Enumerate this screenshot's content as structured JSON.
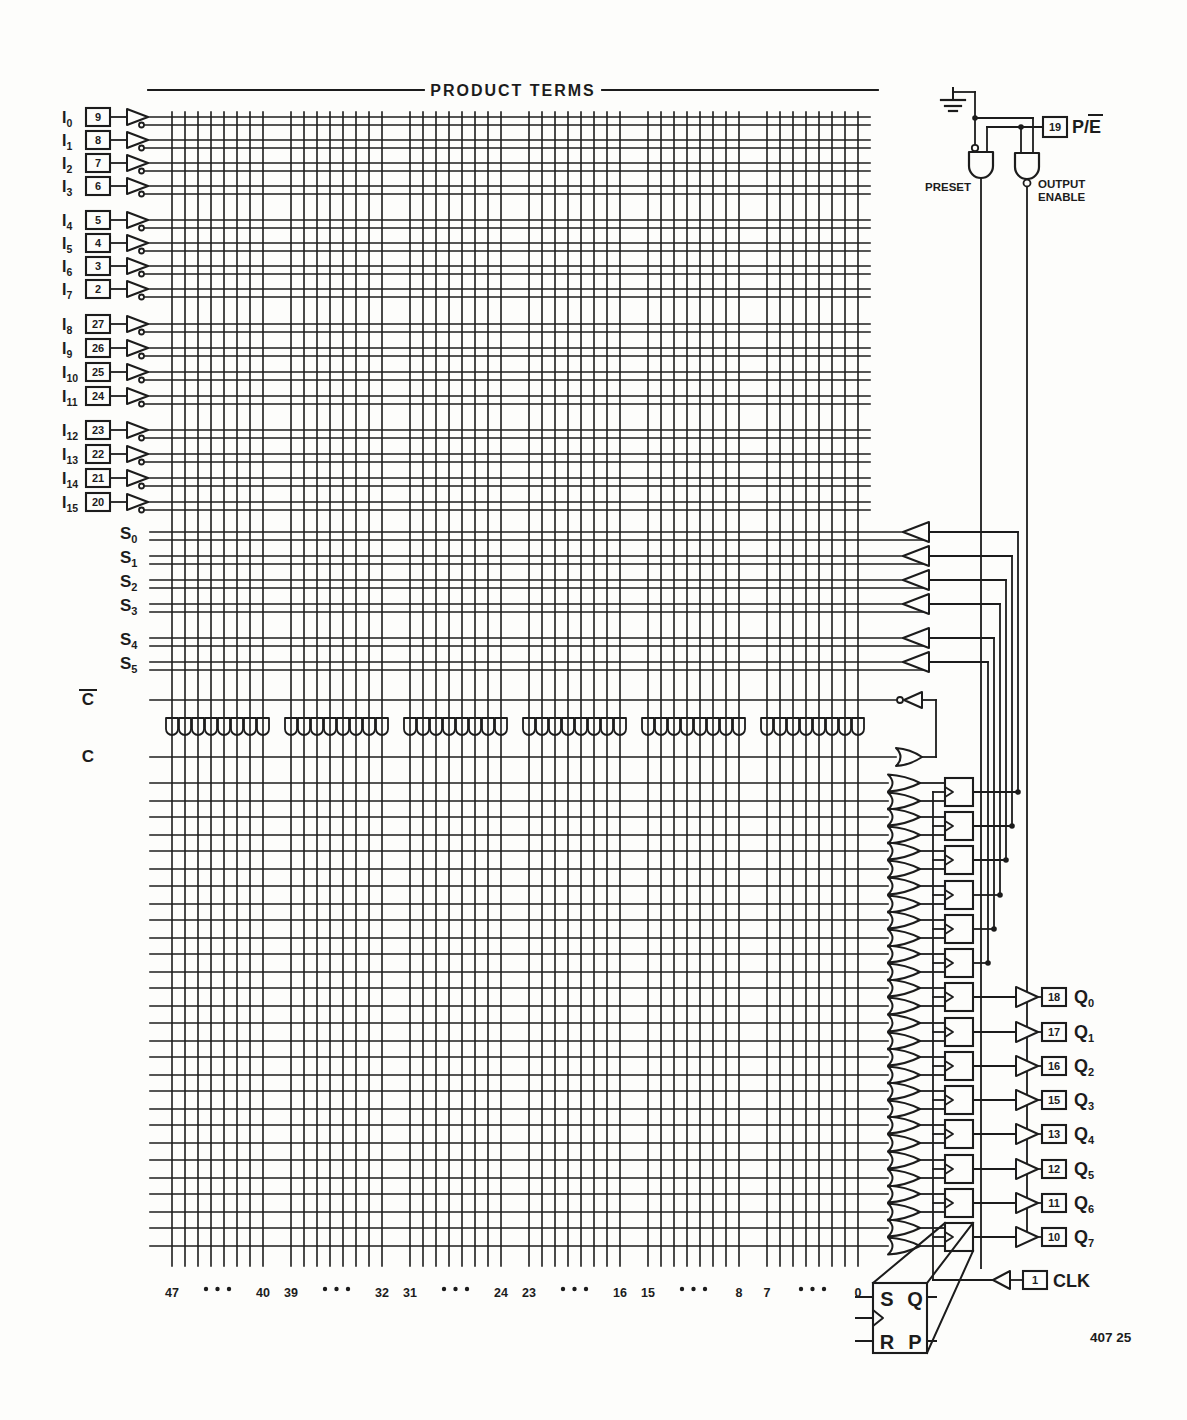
{
  "title": "PRODUCT TERMS",
  "fig_number": "407 25",
  "inputs": [
    {
      "label": "I",
      "sub": "0",
      "pin": "9"
    },
    {
      "label": "I",
      "sub": "1",
      "pin": "8"
    },
    {
      "label": "I",
      "sub": "2",
      "pin": "7"
    },
    {
      "label": "I",
      "sub": "3",
      "pin": "6"
    },
    {
      "label": "I",
      "sub": "4",
      "pin": "5"
    },
    {
      "label": "I",
      "sub": "5",
      "pin": "4"
    },
    {
      "label": "I",
      "sub": "6",
      "pin": "3"
    },
    {
      "label": "I",
      "sub": "7",
      "pin": "2"
    },
    {
      "label": "I",
      "sub": "8",
      "pin": "27"
    },
    {
      "label": "I",
      "sub": "9",
      "pin": "26"
    },
    {
      "label": "I",
      "sub": "10",
      "pin": "25"
    },
    {
      "label": "I",
      "sub": "11",
      "pin": "24"
    },
    {
      "label": "I",
      "sub": "12",
      "pin": "23"
    },
    {
      "label": "I",
      "sub": "13",
      "pin": "22"
    },
    {
      "label": "I",
      "sub": "14",
      "pin": "21"
    },
    {
      "label": "I",
      "sub": "15",
      "pin": "20"
    }
  ],
  "states": [
    {
      "label": "S",
      "sub": "0"
    },
    {
      "label": "S",
      "sub": "1"
    },
    {
      "label": "S",
      "sub": "2"
    },
    {
      "label": "S",
      "sub": "3"
    },
    {
      "label": "S",
      "sub": "4"
    },
    {
      "label": "S",
      "sub": "5"
    }
  ],
  "complement": {
    "cbar_label": "C",
    "c_label": "C"
  },
  "outputs": [
    {
      "label": "Q",
      "sub": "0",
      "pin": "18"
    },
    {
      "label": "Q",
      "sub": "1",
      "pin": "17"
    },
    {
      "label": "Q",
      "sub": "2",
      "pin": "16"
    },
    {
      "label": "Q",
      "sub": "3",
      "pin": "15"
    },
    {
      "label": "Q",
      "sub": "4",
      "pin": "13"
    },
    {
      "label": "Q",
      "sub": "5",
      "pin": "12"
    },
    {
      "label": "Q",
      "sub": "6",
      "pin": "11"
    },
    {
      "label": "Q",
      "sub": "7",
      "pin": "10"
    }
  ],
  "clk": {
    "pin": "1",
    "label": "CLK"
  },
  "pe": {
    "pin": "19",
    "label": "P/E"
  },
  "preset_label": "PRESET",
  "output_enable_label": [
    "OUTPUT",
    "ENABLE"
  ],
  "term_columns": {
    "count": 48,
    "groups": 6,
    "per_group": 8,
    "labels": [
      "47",
      "40",
      "39",
      "32",
      "31",
      "24",
      "23",
      "16",
      "15",
      "8",
      "7",
      "0"
    ]
  },
  "ff_detail": {
    "s": "S",
    "q": "Q",
    "r": "R",
    "p": "P"
  },
  "colors": {
    "ink": "#1c1c1c",
    "paper": "#fdfdfb"
  }
}
